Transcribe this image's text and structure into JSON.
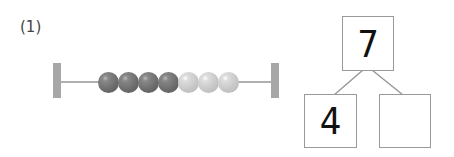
{
  "problem": {
    "label": "(1)",
    "abacus": {
      "dark_beads": 4,
      "light_beads": 3,
      "colors": {
        "dark": "#6e6e6e",
        "light": "#c8c8c8",
        "frame": "#a7a7a7"
      }
    },
    "number_bond": {
      "whole": "7",
      "part_left": "4",
      "part_right": ""
    }
  }
}
